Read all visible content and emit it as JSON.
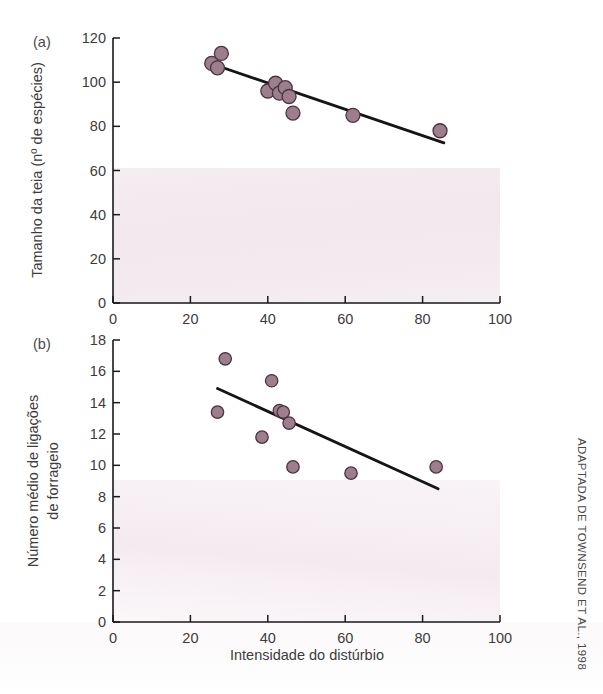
{
  "figure": {
    "credit": "ADAPTADA DE TOWNSEND ET AL., 1998",
    "xlabel": "Intensidade do distúrbio",
    "panel_a_label": "(a)",
    "panel_b_label": "(b)",
    "marker_color": "#9c7e8c",
    "marker_edge_color": "#4d3340",
    "line_color": "#151515"
  },
  "chart_data": [
    {
      "type": "scatter",
      "panel": "(a)",
      "title": "",
      "xlabel": "Intensidade do distúrbio",
      "ylabel": "Tamanho da teia (nº de espécies)",
      "xlim": [
        0,
        100
      ],
      "ylim": [
        0,
        120
      ],
      "xticks": [
        0,
        20,
        40,
        60,
        80,
        100
      ],
      "yticks": [
        0,
        20,
        40,
        60,
        80,
        100,
        120
      ],
      "xticklabels": [
        "0",
        "20",
        "40",
        "60",
        "80",
        "100"
      ],
      "yticklabels": [
        "0",
        "20",
        "40",
        "60",
        "80",
        "100",
        "120"
      ],
      "grid": false,
      "legend": "none",
      "points": [
        {
          "x": 25.5,
          "y": 108.5
        },
        {
          "x": 27.0,
          "y": 106.5
        },
        {
          "x": 28.0,
          "y": 113.0
        },
        {
          "x": 40.0,
          "y": 96.0
        },
        {
          "x": 42.0,
          "y": 99.5
        },
        {
          "x": 43.0,
          "y": 95.0
        },
        {
          "x": 44.5,
          "y": 97.5
        },
        {
          "x": 45.5,
          "y": 93.5
        },
        {
          "x": 46.5,
          "y": 86.0
        },
        {
          "x": 62.0,
          "y": 85.0
        },
        {
          "x": 84.5,
          "y": 78.0
        }
      ],
      "fit_line": {
        "x1": 26.0,
        "y1": 108.0,
        "x2": 85.5,
        "y2": 72.5
      }
    },
    {
      "type": "scatter",
      "panel": "(b)",
      "title": "",
      "xlabel": "Intensidade do distúrbio",
      "ylabel": "Número médio de ligações de forrageio",
      "xlim": [
        0,
        100
      ],
      "ylim": [
        0,
        18
      ],
      "xticks": [
        0,
        20,
        40,
        60,
        80,
        100
      ],
      "yticks": [
        0,
        2,
        4,
        6,
        8,
        10,
        12,
        14,
        16,
        18
      ],
      "xticklabels": [
        "0",
        "20",
        "40",
        "60",
        "80",
        "100"
      ],
      "yticklabels": [
        "0",
        "2",
        "4",
        "6",
        "8",
        "10",
        "12",
        "14",
        "16",
        "18"
      ],
      "grid": false,
      "legend": "none",
      "points": [
        {
          "x": 27.0,
          "y": 13.4
        },
        {
          "x": 29.0,
          "y": 16.8
        },
        {
          "x": 38.5,
          "y": 11.8
        },
        {
          "x": 41.0,
          "y": 15.4
        },
        {
          "x": 43.0,
          "y": 13.5
        },
        {
          "x": 44.0,
          "y": 13.4
        },
        {
          "x": 45.5,
          "y": 12.7
        },
        {
          "x": 46.5,
          "y": 9.9
        },
        {
          "x": 61.5,
          "y": 9.5
        },
        {
          "x": 83.5,
          "y": 9.9
        }
      ],
      "fit_line": {
        "x1": 27.0,
        "y1": 14.9,
        "x2": 84.0,
        "y2": 8.5
      }
    }
  ]
}
